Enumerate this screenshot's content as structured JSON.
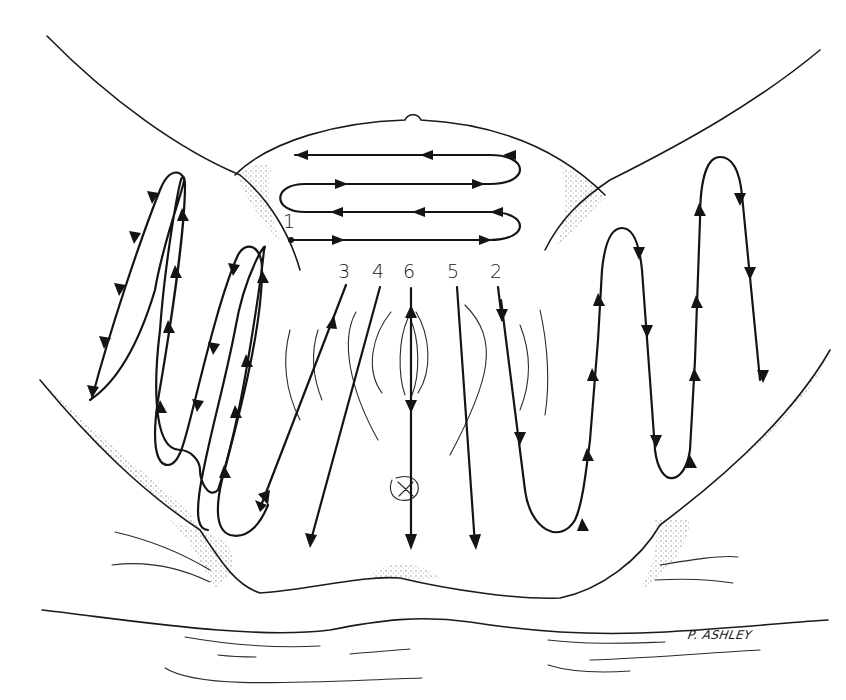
{
  "diagram": {
    "type": "medical-line-illustration",
    "stroke_color": "#141414",
    "background": "#ffffff",
    "labels": [
      {
        "id": "1",
        "text": "1",
        "x": 285,
        "y": 218,
        "desc": "Start point of horizontal serpentine path across suprapubic area"
      },
      {
        "id": "3",
        "text": "3",
        "x": 340,
        "y": 265,
        "desc": "Oblique downward stroke, left"
      },
      {
        "id": "4",
        "text": "4",
        "x": 372,
        "y": 265,
        "desc": "Oblique downward stroke, left-center"
      },
      {
        "id": "6",
        "text": "6",
        "x": 404,
        "y": 265,
        "desc": "Central vertical downward stroke through midline"
      },
      {
        "id": "5",
        "text": "5",
        "x": 447,
        "y": 265,
        "desc": "Downward stroke, right-center"
      },
      {
        "id": "2",
        "text": "2",
        "x": 490,
        "y": 265,
        "desc": "Downward stroke continuing into right thigh serpentine"
      }
    ],
    "signature": "P. ASHLEY",
    "paths": {
      "suprapubic_serpentine": {
        "rows": 4,
        "direction": "zig-zag horizontal",
        "start_label": "1"
      },
      "left_thigh_serpentine": {
        "loops": 2,
        "direction": "vertical zig-zag"
      },
      "right_thigh_serpentine": {
        "loops": 2,
        "direction": "vertical zig-zag",
        "start_label": "2"
      },
      "central_strokes": [
        "3",
        "4",
        "6",
        "5"
      ]
    }
  }
}
